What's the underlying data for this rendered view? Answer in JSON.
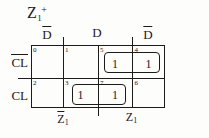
{
  "title": {
    "base": "Z",
    "sub": "1",
    "sup": "+"
  },
  "kmap": {
    "col_labels": [
      {
        "text": "D",
        "overbar": true
      },
      {
        "text": "D",
        "overbar": false
      },
      {
        "text": "D",
        "overbar": true
      }
    ],
    "row_labels": [
      {
        "text": "CL",
        "overbar": true
      },
      {
        "text": "CL",
        "overbar": false
      }
    ],
    "bottom_labels": [
      {
        "base": "Z",
        "sub": "1",
        "overbar": true
      },
      {
        "base": "Z",
        "sub": "1",
        "overbar": false
      }
    ],
    "cells": [
      {
        "num": "0",
        "value": ""
      },
      {
        "num": "1",
        "value": ""
      },
      {
        "num": "5",
        "value": "1"
      },
      {
        "num": "4",
        "value": "1"
      },
      {
        "num": "2",
        "value": ""
      },
      {
        "num": "3",
        "value": "1"
      },
      {
        "num": "7",
        "value": "1"
      },
      {
        "num": "6",
        "value": ""
      }
    ],
    "group_count": 2
  },
  "colors": {
    "ink": "#1b1b1b",
    "background": "#fdfdfc"
  }
}
